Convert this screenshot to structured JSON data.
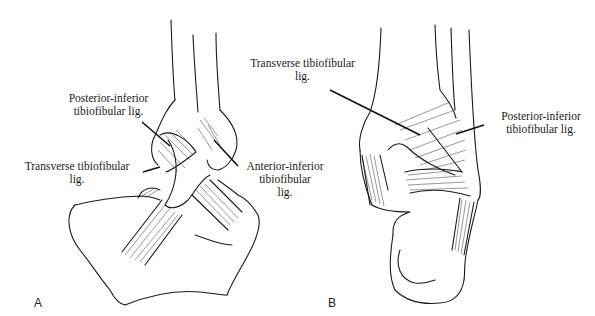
{
  "figure": {
    "panels": [
      {
        "id": "A",
        "label": "A",
        "callouts": [
          {
            "line1": "Posterior-inferior",
            "line2": "tibiofibular lig.",
            "line3": ""
          },
          {
            "line1": "Transverse tibiofibular",
            "line2": "lig.",
            "line3": ""
          },
          {
            "line1": "Anterior-inferior",
            "line2": "tibiofibular",
            "line3": "lig."
          }
        ]
      },
      {
        "id": "B",
        "label": "B",
        "callouts": [
          {
            "line1": "Transverse tibiofibular",
            "line2": "lig.",
            "line3": ""
          },
          {
            "line1": "Posterior-inferior",
            "line2": "tibiofibular lig.",
            "line3": ""
          }
        ]
      }
    ],
    "colors": {
      "ink": "#1a1a1a",
      "background": "#ffffff"
    }
  }
}
